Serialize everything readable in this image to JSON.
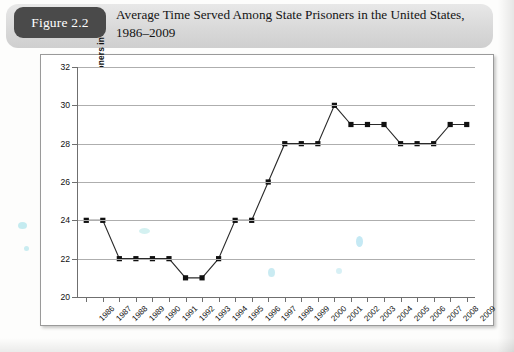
{
  "figure": {
    "badge_label": "Figure 2.2",
    "title_line1": "Average Time Served Among State Prisoners in the United States,",
    "title_line2": "1986–2009",
    "badge_color": "#4a4a4a",
    "band_color": "#dcdcdc"
  },
  "chart_data": {
    "type": "line",
    "title": "Average Time Served Among State Prisoners in the United States, 1986–2009",
    "xlabel": "",
    "ylabel": "Average Time Served for State Prisoners in Months",
    "categories": [
      "1986",
      "1987",
      "1988",
      "1989",
      "1990",
      "1991",
      "1992",
      "1993",
      "1994",
      "1995",
      "1996",
      "1997",
      "1998",
      "1999",
      "2000",
      "2001",
      "2002",
      "2003",
      "2004",
      "2005",
      "2006",
      "2007",
      "2008",
      "2009"
    ],
    "values": [
      24,
      24,
      22,
      22,
      22,
      22,
      21,
      21,
      22,
      24,
      24,
      26,
      28,
      28,
      28,
      30,
      29,
      29,
      29,
      28,
      28,
      28,
      29,
      29
    ],
    "ylim": [
      20,
      32
    ],
    "ytick_values": [
      20,
      22,
      24,
      26,
      28,
      30,
      32
    ],
    "ytick_labels": [
      "20",
      "22",
      "24",
      "26",
      "28",
      "30",
      "32"
    ],
    "grid": true,
    "legend": false,
    "marker": "square",
    "line_color": "#2a2a2a",
    "marker_color": "#111111",
    "grid_color": "#aeaeae"
  }
}
